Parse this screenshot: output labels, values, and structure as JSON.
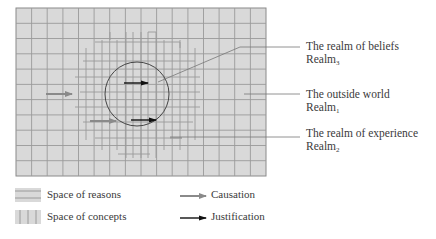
{
  "labels": {
    "beliefs": {
      "title": "The realm of beliefs",
      "realm": "Realm",
      "sub": "3"
    },
    "outside": {
      "title": "The outside world",
      "realm": "Realm",
      "sub": "1"
    },
    "experience": {
      "title": "The realm of experience",
      "realm": "Realm",
      "sub": "2"
    }
  },
  "legend": {
    "reasons": "Space of reasons",
    "concepts": "Space of concepts",
    "causation": "Causation",
    "justification": "Justification"
  },
  "colors": {
    "background": "#d9d9d9",
    "grid_line": "#9a9a9a",
    "circle": "#444444",
    "causation_arrow": "#8a8a8a",
    "justification_arrow": "#111111",
    "pointer_line": "#777777"
  },
  "grid": {
    "columns": 16,
    "rows": 11
  }
}
